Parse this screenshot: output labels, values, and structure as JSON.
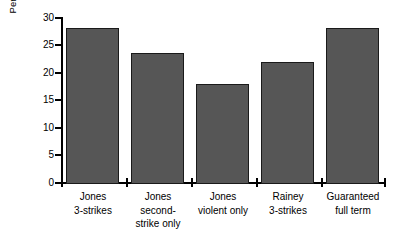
{
  "chart_data": {
    "type": "bar",
    "title": "",
    "subtitle": "",
    "xlabel": "",
    "ylabel": "Percentage reduction in crime",
    "ylim": [
      0,
      30
    ],
    "yticks": [
      0,
      5,
      10,
      15,
      20,
      25,
      30
    ],
    "ytick_labels": [
      "0",
      "5",
      "10",
      "15",
      "20",
      "25",
      "30"
    ],
    "grid": false,
    "legend": null,
    "legend_position": "none",
    "bar_color": "#565656",
    "bar_edge_color": "#1a1a1a",
    "background_color": "#ffffff",
    "axis_color": "#000000",
    "categories": [
      "Jones 3-strikes",
      "Jones second-strike only",
      "Jones violent only",
      "Rainey 3-strikes",
      "Guaranteed full term"
    ],
    "category_lines": [
      [
        "Jones",
        "3-strikes"
      ],
      [
        "Jones",
        "second-",
        "strike only"
      ],
      [
        "Jones",
        "violent only"
      ],
      [
        "Rainey",
        "3-strikes"
      ],
      [
        "Guaranteed",
        "full term"
      ]
    ],
    "values": [
      28,
      23.5,
      18,
      22,
      28
    ]
  },
  "axis": {
    "y_title": "Percentage reduction in crime",
    "tick_0": "0",
    "tick_5": "5",
    "tick_10": "10",
    "tick_15": "15",
    "tick_20": "20",
    "tick_25": "25",
    "tick_30": "30"
  },
  "categories": {
    "c0_l0": "Jones",
    "c0_l1": "3-strikes",
    "c1_l0": "Jones",
    "c1_l1": "second-",
    "c1_l2": "strike only",
    "c2_l0": "Jones",
    "c2_l1": "violent only",
    "c3_l0": "Rainey",
    "c3_l1": "3-strikes",
    "c4_l0": "Guaranteed",
    "c4_l1": "full term"
  }
}
